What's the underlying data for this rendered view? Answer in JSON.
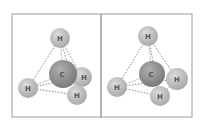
{
  "figure": {
    "panels": [
      {
        "label": "left-methane-model",
        "atoms": [
          {
            "symbol": "H",
            "x": 60,
            "y": 38,
            "r": 10,
            "role": "top"
          },
          {
            "symbol": "H",
            "x": 28,
            "y": 88,
            "r": 10,
            "role": "left"
          },
          {
            "symbol": "H",
            "x": 82,
            "y": 77,
            "r": 10,
            "role": "right"
          },
          {
            "symbol": "C",
            "x": 63,
            "y": 74,
            "r": 14,
            "role": "center"
          },
          {
            "symbol": "H",
            "x": 77,
            "y": 95,
            "r": 10,
            "role": "bottom"
          }
        ]
      },
      {
        "label": "right-methane-model",
        "atoms": [
          {
            "symbol": "H",
            "x": 148,
            "y": 36,
            "r": 10,
            "role": "top"
          },
          {
            "symbol": "H",
            "x": 117,
            "y": 87,
            "r": 10,
            "role": "left"
          },
          {
            "symbol": "H",
            "x": 177,
            "y": 79,
            "r": 11,
            "role": "right"
          },
          {
            "symbol": "C",
            "x": 152,
            "y": 74,
            "r": 13,
            "role": "center"
          },
          {
            "symbol": "H",
            "x": 160,
            "y": 96,
            "r": 10,
            "role": "bottom"
          }
        ]
      }
    ],
    "colors": {
      "frame": "#9a9a9a",
      "hydrogen": "#bdbdbd",
      "carbon": "#8f8f8f",
      "edge": "#555555",
      "label": "#555555"
    }
  }
}
